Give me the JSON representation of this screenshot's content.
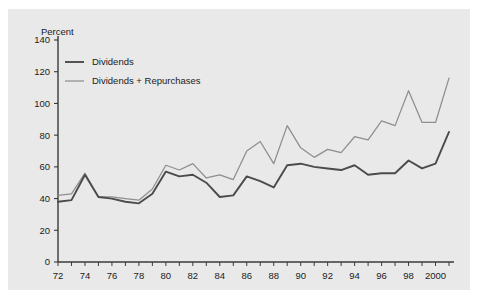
{
  "figure": {
    "background_color": "#e9e9e9",
    "page_color": "#ffffff"
  },
  "axis_title": "Percent",
  "legend": {
    "position": "top-left-inside",
    "entries": [
      {
        "label": "Dividends",
        "color": "#4b4b4b"
      },
      {
        "label": "Dividends + Repurchases",
        "color": "#8e8e8e"
      }
    ]
  },
  "y_axis": {
    "ticks": [
      "0",
      "20",
      "40",
      "60",
      "80",
      "100",
      "120",
      "140"
    ],
    "min": 0,
    "max": 140
  },
  "x_axis": {
    "ticks": [
      "72",
      "74",
      "76",
      "78",
      "80",
      "82",
      "84",
      "86",
      "88",
      "90",
      "92",
      "94",
      "96",
      "98",
      "2000"
    ],
    "min": 1972,
    "max": 2001
  },
  "chart_data": {
    "type": "line",
    "title": "",
    "xlabel": "",
    "ylabel": "Percent",
    "ylim": [
      0,
      140
    ],
    "xlim": [
      1972,
      2001
    ],
    "grid": false,
    "legend_position": "top-left-inside",
    "x": [
      1972,
      1973,
      1974,
      1975,
      1976,
      1977,
      1978,
      1979,
      1980,
      1981,
      1982,
      1983,
      1984,
      1985,
      1986,
      1987,
      1988,
      1989,
      1990,
      1991,
      1992,
      1993,
      1994,
      1995,
      1996,
      1997,
      1998,
      1999,
      2000,
      2001
    ],
    "categories": [
      "72",
      "73",
      "74",
      "75",
      "76",
      "77",
      "78",
      "79",
      "80",
      "81",
      "82",
      "83",
      "84",
      "85",
      "86",
      "87",
      "88",
      "89",
      "90",
      "91",
      "92",
      "93",
      "94",
      "95",
      "96",
      "97",
      "98",
      "99",
      "2000",
      "2001"
    ],
    "series": [
      {
        "name": "Dividends",
        "color": "#4b4b4b",
        "values": [
          38,
          39,
          55,
          41,
          40,
          38,
          37,
          43,
          57,
          54,
          55,
          50,
          41,
          42,
          54,
          51,
          47,
          61,
          62,
          60,
          59,
          58,
          61,
          55,
          56,
          56,
          64,
          59,
          62,
          82
        ]
      },
      {
        "name": "Dividends + Repurchases",
        "color": "#8e8e8e",
        "values": [
          42,
          43,
          56,
          41,
          41,
          40,
          39,
          46,
          61,
          58,
          62,
          53,
          55,
          52,
          70,
          76,
          62,
          86,
          72,
          66,
          71,
          69,
          79,
          77,
          89,
          86,
          108,
          88,
          88,
          116
        ]
      }
    ]
  }
}
